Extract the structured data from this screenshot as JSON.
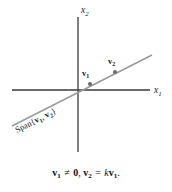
{
  "figure": {
    "name": "span-of-two-dependent-vectors",
    "axes": {
      "x_axis_label": "x",
      "x_axis_subscript": "1",
      "y_axis_label": "x",
      "y_axis_subscript": "2",
      "axis_color": "#3a3a3a",
      "origin": {
        "x": 78,
        "y": 90
      },
      "x_axis_extent": {
        "x1": 12,
        "x2": 150,
        "y": 90
      },
      "y_axis_extent": {
        "y1": 17,
        "y2": 152,
        "x": 78
      }
    },
    "span_line": {
      "color": "#9a9a9a",
      "start": {
        "x": 12,
        "y": 126
      },
      "end": {
        "x": 152,
        "y": 55
      },
      "label_text": "Span{",
      "label_vec1": "v",
      "label_vec1_sub": "1",
      "label_comma": ", ",
      "label_vec2": "v",
      "label_vec2_sub": "2",
      "label_close": "}",
      "label_rotation_deg": -27
    },
    "points": [
      {
        "id": "v1",
        "label": "v",
        "subscript": "1",
        "dot": {
          "x": 90,
          "y": 84
        },
        "label_pos": {
          "x": 84,
          "y": 75
        },
        "dot_color": "#6e6e6e"
      },
      {
        "id": "v2",
        "label": "v",
        "subscript": "2",
        "dot": {
          "x": 115,
          "y": 72
        },
        "label_pos": {
          "x": 109,
          "y": 63
        },
        "dot_color": "#6e6e6e"
      }
    ]
  },
  "caption": {
    "vec1": "v",
    "vec1_sub": "1",
    "not_equal": " ≠ ",
    "zero": "0",
    "separator": ", ",
    "vec2": "v",
    "vec2_sub": "2",
    "equals": " = ",
    "scalar": "k",
    "vec1_again": "v",
    "vec1_again_sub": "1",
    "period": "."
  }
}
